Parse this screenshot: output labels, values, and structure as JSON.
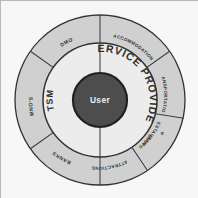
{
  "figure": {
    "center": {
      "label": "User",
      "fill": "#4a4a4a",
      "text_color": "#f2f2f2"
    },
    "inner_ring": {
      "fill": "#f2f2f2",
      "segments": [
        {
          "label": "TSM",
          "side": "left"
        },
        {
          "label": "SERVICE PROVIDER",
          "side": "right"
        }
      ]
    },
    "outer_ring": {
      "fill": "#d4d4d4",
      "segments": [
        {
          "label": "DMO"
        },
        {
          "label": "ACCOMMODATION"
        },
        {
          "label": "TRANSPORTATION"
        },
        {
          "label": "RESTAURANTS & SHOPS",
          "line1": "RESTAURANTS",
          "line2": "&",
          "line3": "SHOPS"
        },
        {
          "label": "ATTRACTIONS"
        },
        {
          "label": "BANKS"
        },
        {
          "label": "MNO'S"
        }
      ]
    },
    "colors": {
      "outer_fill": "#d4d4d4",
      "inner_fill": "#f2f2f2",
      "center_fill": "#4a4a4a",
      "stroke": "#2e2e2e",
      "border": "#b9b9b9",
      "background": "#fdfdfd"
    }
  }
}
